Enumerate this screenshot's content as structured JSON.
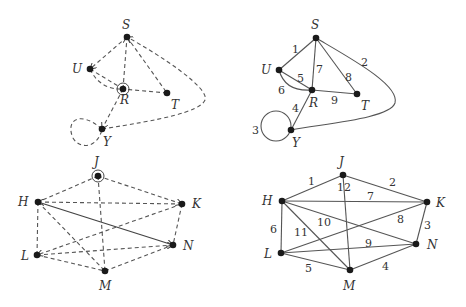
{
  "figures": [
    {
      "id": "top-left",
      "style": "dashed-traversal",
      "nodes": [
        {
          "label": "S",
          "x": 127,
          "y": 37
        },
        {
          "label": "U",
          "x": 90,
          "y": 69
        },
        {
          "label": "R",
          "x": 123,
          "y": 89,
          "start": true
        },
        {
          "label": "T",
          "x": 167,
          "y": 93
        },
        {
          "label": "Y",
          "x": 102,
          "y": 129
        }
      ]
    },
    {
      "id": "top-right",
      "style": "numbered-edges",
      "nodes": [
        {
          "label": "S",
          "x": 316,
          "y": 38
        },
        {
          "label": "U",
          "x": 279,
          "y": 70
        },
        {
          "label": "R",
          "x": 312,
          "y": 90
        },
        {
          "label": "T",
          "x": 357,
          "y": 94
        },
        {
          "label": "Y",
          "x": 291,
          "y": 130
        }
      ],
      "edge_labels": [
        "1",
        "2",
        "3",
        "4",
        "5",
        "6",
        "7",
        "8",
        "9"
      ]
    },
    {
      "id": "bottom-left",
      "style": "dashed-traversal",
      "nodes": [
        {
          "label": "J",
          "x": 98,
          "y": 176,
          "start": true
        },
        {
          "label": "H",
          "x": 38,
          "y": 202
        },
        {
          "label": "K",
          "x": 182,
          "y": 204
        },
        {
          "label": "N",
          "x": 173,
          "y": 245
        },
        {
          "label": "L",
          "x": 37,
          "y": 255
        },
        {
          "label": "M",
          "x": 105,
          "y": 271
        }
      ]
    },
    {
      "id": "bottom-right",
      "style": "numbered-edges",
      "nodes": [
        {
          "label": "J",
          "x": 343,
          "y": 175
        },
        {
          "label": "H",
          "x": 282,
          "y": 201
        },
        {
          "label": "K",
          "x": 427,
          "y": 202
        },
        {
          "label": "N",
          "x": 416,
          "y": 244
        },
        {
          "label": "L",
          "x": 281,
          "y": 253
        },
        {
          "label": "M",
          "x": 350,
          "y": 270
        }
      ],
      "edge_labels": [
        "1",
        "2",
        "3",
        "4",
        "5",
        "6",
        "7",
        "8",
        "9",
        "10",
        "11",
        "12"
      ]
    }
  ],
  "labels": {
    "tl": {
      "S": "S",
      "U": "U",
      "R": "R",
      "T": "T",
      "Y": "Y"
    },
    "tr": {
      "S": "S",
      "U": "U",
      "R": "R",
      "T": "T",
      "Y": "Y",
      "e1": "1",
      "e2": "2",
      "e3": "3",
      "e4": "4",
      "e5": "5",
      "e6": "6",
      "e7": "7",
      "e8": "8",
      "e9": "9"
    },
    "bl": {
      "J": "J",
      "H": "H",
      "K": "K",
      "N": "N",
      "L": "L",
      "M": "M"
    },
    "br": {
      "J": "J",
      "H": "H",
      "K": "K",
      "N": "N",
      "L": "L",
      "M": "M",
      "e1": "1",
      "e2": "2",
      "e3": "3",
      "e4": "4",
      "e5": "5",
      "e6": "6",
      "e7": "7",
      "e8": "8",
      "e9": "9",
      "e10": "10",
      "e11": "11",
      "e12": "12"
    }
  }
}
